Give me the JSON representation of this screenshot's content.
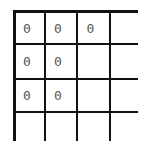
{
  "grid": {
    "rows": 4,
    "cols": 4,
    "cells": [
      [
        "0",
        "0",
        "0",
        ""
      ],
      [
        "0",
        "0",
        "",
        ""
      ],
      [
        "0",
        "0",
        "",
        ""
      ],
      [
        "",
        "",
        "",
        ""
      ]
    ]
  }
}
